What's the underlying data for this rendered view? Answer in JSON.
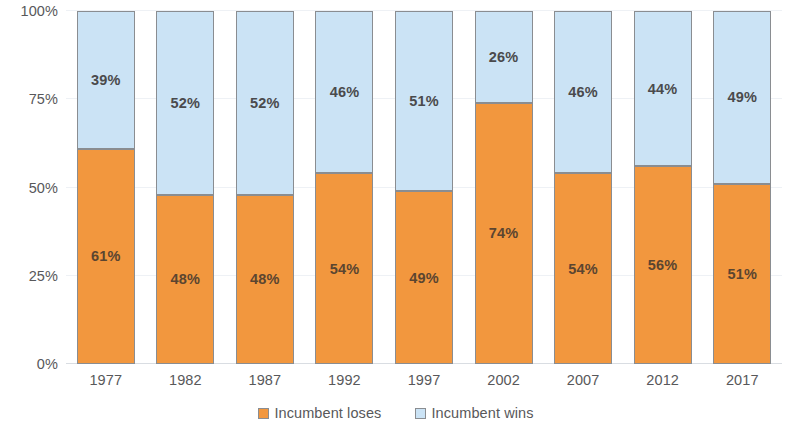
{
  "chart_data": {
    "type": "bar",
    "subtype": "stacked-100-percent",
    "title": "",
    "subtitle": "",
    "xlabel": "",
    "ylabel": "",
    "categories": [
      "1977",
      "1982",
      "1987",
      "1992",
      "1997",
      "2002",
      "2007",
      "2012",
      "2017"
    ],
    "series": [
      {
        "name": "Incumbent loses",
        "color": "#f2973e",
        "values": [
          61,
          48,
          48,
          54,
          49,
          74,
          54,
          56,
          51
        ],
        "labels": [
          "61%",
          "48%",
          "48%",
          "54%",
          "49%",
          "74%",
          "54%",
          "56%",
          "51%"
        ]
      },
      {
        "name": "Incumbent wins",
        "color": "#cbe3f5",
        "values": [
          39,
          52,
          52,
          46,
          51,
          26,
          46,
          44,
          49
        ],
        "labels": [
          "39%",
          "52%",
          "52%",
          "46%",
          "51%",
          "26%",
          "46%",
          "44%",
          "49%"
        ]
      }
    ],
    "ylim": [
      0,
      100
    ],
    "yticks": [
      0,
      25,
      50,
      75,
      100
    ],
    "ytick_labels": [
      "0%",
      "25%",
      "50%",
      "75%",
      "100%"
    ],
    "grid": true,
    "grid_axis": "y",
    "legend_position": "bottom"
  },
  "legend": {
    "items": [
      {
        "label": "Incumbent loses",
        "color": "#f2973e"
      },
      {
        "label": "Incumbent wins",
        "color": "#cbe3f5"
      }
    ]
  },
  "colors": {
    "series_lose": "#f2973e",
    "series_win": "#cbe3f5",
    "bar_border": "#8a8d91",
    "gridline": "#eef1f5",
    "axis_text": "#58585a",
    "background": "#ffffff"
  }
}
